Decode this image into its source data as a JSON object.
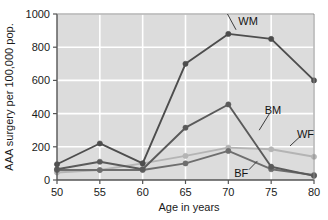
{
  "chart_data": {
    "type": "line",
    "title": "",
    "xlabel": "Age in years",
    "ylabel": "AAA surgery per 100,000 pop.",
    "x": [
      50,
      55,
      60,
      65,
      70,
      75,
      80
    ],
    "xlim": [
      50,
      80
    ],
    "ylim": [
      0,
      1000
    ],
    "xticks": [
      "50",
      "55",
      "60",
      "65",
      "70",
      "75",
      "80"
    ],
    "yticks": [
      "0",
      "200",
      "400",
      "600",
      "800",
      "1000"
    ],
    "grid": true,
    "legend_position": "inline-annotations",
    "series": [
      {
        "name": "WM",
        "label": "WM",
        "color": "#4d4d4d",
        "values": [
          95,
          220,
          100,
          700,
          880,
          850,
          600
        ]
      },
      {
        "name": "BM",
        "label": "BM",
        "color": "#5a5a5a",
        "values": [
          65,
          110,
          65,
          315,
          455,
          80,
          25
        ]
      },
      {
        "name": "BF",
        "label": "BF",
        "color": "#6e6e6e",
        "values": [
          60,
          60,
          60,
          100,
          175,
          65,
          30
        ]
      },
      {
        "name": "WF",
        "label": "WF",
        "color": "#b4b4b4",
        "values": [
          45,
          60,
          100,
          145,
          195,
          185,
          140
        ]
      }
    ],
    "annotations": [
      {
        "text": "WM",
        "x": 72.3,
        "y": 960
      },
      {
        "text": "BM",
        "x": 75.2,
        "y": 420
      },
      {
        "text": "WF",
        "x": 79.0,
        "y": 275
      },
      {
        "text": "BF",
        "x": 71.5,
        "y": 45
      }
    ],
    "colors": {
      "plot_background": "#dcdcdc",
      "grid": "#ffffff",
      "axis": "#555555",
      "text": "#1a1a1a"
    }
  }
}
